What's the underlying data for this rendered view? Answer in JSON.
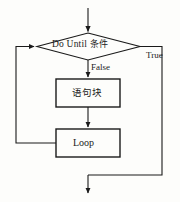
{
  "diagram": {
    "type": "flowchart",
    "background_color": "#fdfdfb",
    "stroke_color": "#1a1a1a",
    "text_color": "#1a1a1a",
    "nodes": [
      {
        "id": "decision",
        "shape": "diamond",
        "label_en": "Do Until",
        "label_zh": "条件",
        "label_full": "Do Until 条件"
      },
      {
        "id": "statement-block",
        "shape": "rectangle",
        "label": "语句块"
      },
      {
        "id": "loop",
        "shape": "rectangle",
        "label": "Loop"
      }
    ],
    "edge_labels": {
      "true": "True",
      "false": "False"
    },
    "edges": [
      {
        "from": "entry",
        "to": "decision",
        "label": ""
      },
      {
        "from": "decision",
        "to": "statement-block",
        "label": "False"
      },
      {
        "from": "decision",
        "to": "exit",
        "label": "True"
      },
      {
        "from": "statement-block",
        "to": "loop",
        "label": ""
      },
      {
        "from": "loop",
        "to": "decision",
        "label": ""
      }
    ]
  }
}
